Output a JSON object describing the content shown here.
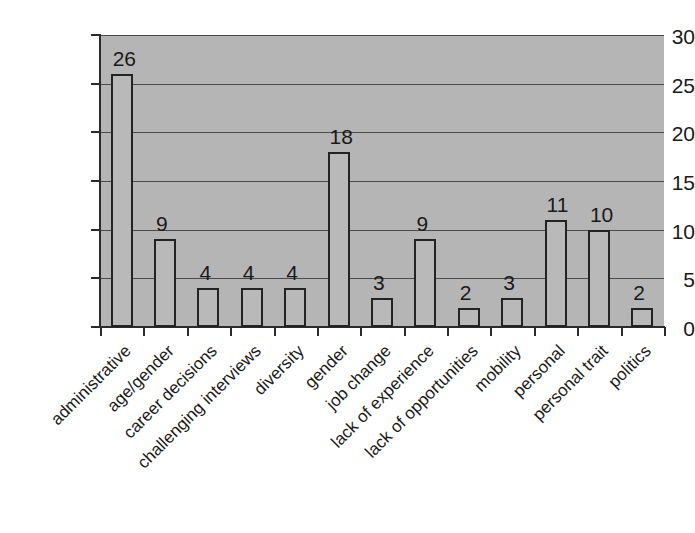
{
  "chart_data": {
    "type": "bar",
    "title": "",
    "xlabel": "",
    "ylabel": "",
    "ylim": [
      0,
      30
    ],
    "yticks": [
      0,
      5,
      10,
      15,
      20,
      25,
      30
    ],
    "grid": true,
    "legend": "none",
    "data_labels": true,
    "categories": [
      "administrative",
      "age/gender",
      "career decisions",
      "challenging interviews",
      "diversity",
      "gender",
      "job change",
      "lack of experience",
      "lack of opportunities",
      "mobility",
      "personal",
      "personal trait",
      "politics"
    ],
    "values": [
      26,
      9,
      4,
      4,
      4,
      18,
      3,
      9,
      2,
      3,
      11,
      10,
      2
    ],
    "value_labels": [
      "26",
      "9",
      "4",
      "4",
      "4",
      "18",
      "3",
      "9",
      "2",
      "3",
      "11",
      "10",
      "2"
    ],
    "colors": {
      "plot_background": "#b5b5b5",
      "figure_background": "#ffffff",
      "bar_fill": "#b9b9b9",
      "bar_edge": "#232323",
      "gridline": "#4a4a4a",
      "axis": "#2b2b2b",
      "text": "#1a1a1a"
    }
  },
  "axis": {
    "y_tick_labels": [
      "0",
      "5",
      "10",
      "15",
      "20",
      "25",
      "30"
    ]
  }
}
